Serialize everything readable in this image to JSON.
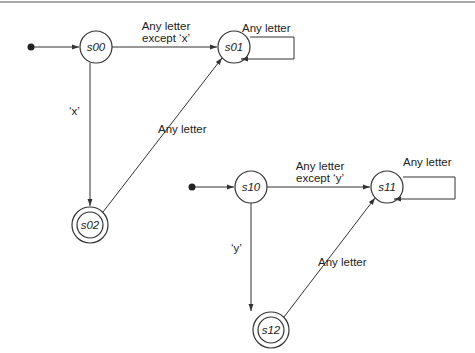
{
  "diagram": {
    "type": "finite-state-machines",
    "machines": [
      {
        "states": [
          {
            "id": "s00",
            "label": "s00",
            "initial": true,
            "accepting": false
          },
          {
            "id": "s01",
            "label": "s01",
            "initial": false,
            "accepting": false
          },
          {
            "id": "s02",
            "label": "s02",
            "initial": false,
            "accepting": true
          }
        ],
        "transitions": [
          {
            "from": "s00",
            "to": "s01",
            "label_line1": "Any letter",
            "label_line2": "except ‘x’"
          },
          {
            "from": "s01",
            "to": "s01",
            "label": "Any letter"
          },
          {
            "from": "s00",
            "to": "s02",
            "label": "‘x’"
          },
          {
            "from": "s02",
            "to": "s01",
            "label": "Any letter"
          }
        ]
      },
      {
        "states": [
          {
            "id": "s10",
            "label": "s10",
            "initial": true,
            "accepting": false
          },
          {
            "id": "s11",
            "label": "s11",
            "initial": false,
            "accepting": false
          },
          {
            "id": "s12",
            "label": "s12",
            "initial": false,
            "accepting": true
          }
        ],
        "transitions": [
          {
            "from": "s10",
            "to": "s11",
            "label_line1": "Any letter",
            "label_line2": "except ‘y’"
          },
          {
            "from": "s11",
            "to": "s11",
            "label": "Any letter"
          },
          {
            "from": "s10",
            "to": "s12",
            "label": "‘y’"
          },
          {
            "from": "s12",
            "to": "s11",
            "label": "Any letter"
          }
        ]
      }
    ]
  }
}
